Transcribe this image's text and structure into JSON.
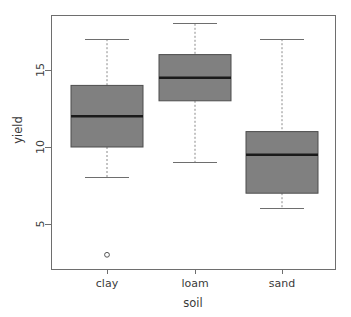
{
  "chart_data": {
    "type": "box",
    "title": "",
    "xlabel": "soil",
    "ylabel": "yield",
    "categories": [
      "clay",
      "loam",
      "sand"
    ],
    "xtick_labels": [
      "clay",
      "loam",
      "sand"
    ],
    "ytick_labels": [
      "5",
      "10",
      "15"
    ],
    "ytick_values": [
      5,
      10,
      15
    ],
    "ylim": [
      2.4,
      18.6
    ],
    "grid": false,
    "legend": null,
    "box_fill_color": "#808080",
    "median_color": "#1a1a1a",
    "whisker_color": "#8a8a8a",
    "frame_color": "#6e6e6e",
    "boxes": [
      {
        "category": "clay",
        "whisker_low": 8,
        "q1": 10,
        "median": 12,
        "q3": 14,
        "whisker_high": 17,
        "outliers": [
          3
        ]
      },
      {
        "category": "loam",
        "whisker_low": 9,
        "q1": 13,
        "median": 14.5,
        "q3": 16,
        "whisker_high": 18,
        "outliers": []
      },
      {
        "category": "sand",
        "whisker_low": 6,
        "q1": 7,
        "median": 9.5,
        "q3": 11,
        "whisker_high": 17,
        "outliers": []
      }
    ]
  }
}
